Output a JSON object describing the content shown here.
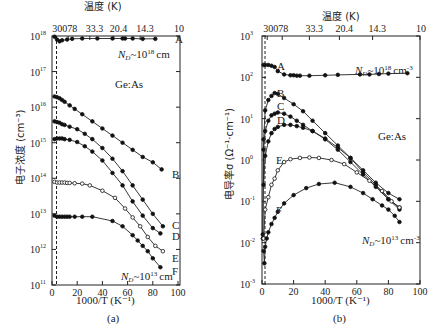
{
  "chart_data": [
    {
      "type": "line",
      "panel_label": "(a)",
      "title": "",
      "xlabel": "1000/T (K⁻¹)",
      "ylabel": "电子浓度 (cm⁻³)",
      "top_axis_label": "温度 (K)",
      "top_ticks": [
        "300",
        "78",
        "33.3",
        "20.4",
        "14.3",
        "10"
      ],
      "top_tick_positions_x": [
        3.3,
        12.8,
        30,
        49,
        70,
        100
      ],
      "xlim": [
        0,
        100
      ],
      "xticks": [
        "0",
        "20",
        "40",
        "60",
        "80",
        "100"
      ],
      "yscale": "log",
      "ylim_exp": [
        11,
        18
      ],
      "yticks": [
        "10^11",
        "10^12",
        "10^13",
        "10^14",
        "10^15",
        "10^16",
        "10^17",
        "10^18"
      ],
      "annotations": [
        "Ge:As",
        "N_D~10^18 cm^-3",
        "N_D~10^13 cm^-3"
      ],
      "dashed_vline_x": 3.5,
      "series": [
        {
          "name": "A",
          "marker": "filled",
          "x": [
            2,
            4,
            6,
            8,
            12,
            16,
            24,
            36,
            48,
            56,
            58,
            64,
            72,
            82
          ],
          "log10_y": [
            17.98,
            17.9,
            17.85,
            17.88,
            17.9,
            17.92,
            17.93,
            17.93,
            17.93,
            17.93,
            17.93,
            17.93,
            17.92,
            17.92
          ]
        },
        {
          "name": "B",
          "marker": "filled",
          "x": [
            2,
            4,
            6,
            8,
            10,
            14,
            18,
            24,
            32,
            40,
            48,
            56,
            64,
            72,
            80,
            87
          ],
          "log10_y": [
            16.3,
            16.28,
            16.25,
            16.2,
            16.15,
            16.05,
            15.95,
            15.8,
            15.6,
            15.4,
            15.2,
            15.0,
            14.8,
            14.6,
            14.45,
            14.25
          ]
        },
        {
          "name": "C",
          "marker": "filled",
          "x": [
            2,
            4,
            6,
            8,
            10,
            14,
            20,
            26,
            32,
            40,
            48,
            56,
            64,
            72,
            80,
            88
          ],
          "log10_y": [
            15.6,
            15.58,
            15.56,
            15.52,
            15.5,
            15.45,
            15.38,
            15.25,
            15.1,
            14.85,
            14.55,
            14.2,
            13.8,
            13.4,
            13.0,
            12.65
          ]
        },
        {
          "name": "D",
          "marker": "filled",
          "x": [
            2,
            4,
            6,
            8,
            10,
            14,
            20,
            26,
            32,
            40,
            48,
            56,
            64,
            72,
            80,
            86
          ],
          "log10_y": [
            15.1,
            15.12,
            15.12,
            15.12,
            15.1,
            15.08,
            15.02,
            14.9,
            14.75,
            14.5,
            14.15,
            13.8,
            13.35,
            12.95,
            12.6,
            12.45
          ]
        },
        {
          "name": "E",
          "marker": "open",
          "x": [
            2,
            4,
            6,
            8,
            10,
            12,
            14,
            18,
            24,
            30,
            40,
            50,
            58,
            64,
            70,
            76,
            82,
            88
          ],
          "log10_y": [
            13.9,
            13.88,
            13.88,
            13.88,
            13.88,
            13.87,
            13.87,
            13.86,
            13.85,
            13.8,
            13.65,
            13.45,
            13.15,
            12.9,
            12.65,
            12.35,
            12.1,
            11.95
          ]
        },
        {
          "name": "F",
          "marker": "filled",
          "x": [
            2,
            4,
            6,
            8,
            10,
            12,
            14,
            18,
            24,
            32,
            48,
            56,
            64,
            68,
            72,
            76,
            80,
            86
          ],
          "log10_y": [
            12.95,
            12.92,
            12.92,
            12.92,
            12.92,
            12.92,
            12.92,
            12.92,
            12.92,
            12.92,
            12.8,
            12.65,
            12.4,
            12.25,
            12.1,
            11.95,
            11.75,
            11.5
          ]
        }
      ],
      "series_labels_right": [
        "A",
        "B",
        "C",
        "D",
        "E",
        "F"
      ]
    },
    {
      "type": "line",
      "panel_label": "(b)",
      "title": "",
      "xlabel": "1000/T (K⁻¹)",
      "ylabel": "电导率σ (Ω⁻¹·cm⁻¹)",
      "top_axis_label": "温度 (K)",
      "top_ticks": [
        "300",
        "78",
        "33.3",
        "20.4",
        "14.3",
        "10"
      ],
      "top_tick_positions_x": [
        3.3,
        12.8,
        30,
        49,
        70,
        100
      ],
      "xlim": [
        0,
        100
      ],
      "xticks": [
        "0",
        "20",
        "40",
        "60",
        "80",
        "100"
      ],
      "yscale": "log",
      "ylim_exp": [
        -3,
        3
      ],
      "yticks": [
        "10^-3",
        "10^-2",
        "10^-1",
        "10^0",
        "10^1",
        "10^2",
        "10^3"
      ],
      "annotations": [
        "Ge:As",
        "N_D~10^18 cm^-3",
        "N_D~10^13 cm^-3"
      ],
      "dashed_vline_x": 2,
      "series": [
        {
          "name": "A",
          "marker": "filled",
          "x": [
            1,
            2,
            4,
            6,
            8,
            10,
            14,
            18,
            20,
            22,
            24,
            30,
            40,
            48,
            62,
            68,
            74,
            80,
            92
          ],
          "log10_y": [
            2.3,
            2.3,
            2.3,
            2.28,
            2.25,
            2.15,
            2.07,
            2.05,
            2.05,
            2.04,
            2.04,
            2.04,
            2.05,
            2.06,
            2.07,
            2.07,
            2.08,
            2.09,
            2.1
          ]
        },
        {
          "name": "B",
          "marker": "filled",
          "x": [
            0.5,
            1,
            2,
            4,
            6,
            8,
            10,
            14,
            20,
            26,
            32,
            40,
            48,
            56,
            64,
            72,
            80,
            87
          ],
          "log10_y": [
            -1.9,
            0.5,
            1.2,
            1.45,
            1.55,
            1.62,
            1.6,
            1.5,
            1.35,
            1.18,
            0.95,
            0.65,
            0.35,
            0.05,
            -0.25,
            -0.55,
            -0.8,
            -0.95
          ]
        },
        {
          "name": "C",
          "marker": "filled",
          "x": [
            0.5,
            1,
            2,
            4,
            6,
            8,
            10,
            14,
            18,
            22,
            26,
            32,
            40,
            48,
            56,
            64,
            72,
            80,
            87
          ],
          "log10_y": [
            -1.8,
            0.25,
            0.7,
            0.95,
            1.08,
            1.12,
            1.15,
            1.12,
            1.05,
            0.95,
            0.85,
            0.7,
            0.5,
            0.25,
            -0.05,
            -0.35,
            -0.65,
            -0.95,
            -1.15
          ]
        },
        {
          "name": "D",
          "marker": "filled",
          "x": [
            1,
            2,
            4,
            6,
            8,
            10,
            14,
            18,
            22,
            26,
            32,
            40,
            48,
            56,
            64,
            72,
            80,
            87
          ],
          "log10_y": [
            -0.6,
            0.1,
            0.45,
            0.65,
            0.75,
            0.8,
            0.85,
            0.85,
            0.82,
            0.78,
            0.7,
            0.52,
            0.3,
            0.05,
            -0.3,
            -0.6,
            -0.95,
            -1.2
          ]
        },
        {
          "name": "E",
          "marker": "open",
          "x": [
            1,
            2,
            4,
            6,
            8,
            10,
            14,
            18,
            24,
            30,
            36,
            44,
            52,
            60,
            68,
            76,
            82,
            87
          ],
          "log10_y": [
            -1.9,
            -1.2,
            -0.9,
            -0.6,
            -0.45,
            -0.25,
            -0.05,
            0.02,
            0.05,
            0.06,
            0.05,
            0.0,
            -0.1,
            -0.3,
            -0.5,
            -0.75,
            -1.0,
            -1.15
          ]
        },
        {
          "name": "F",
          "marker": "filled",
          "x": [
            1,
            1.5,
            2,
            3,
            4,
            6,
            8,
            10,
            14,
            20,
            28,
            36,
            46,
            56,
            64,
            70,
            76,
            80,
            84,
            87
          ],
          "log10_y": [
            -2.2,
            -2.5,
            -2.1,
            -1.9,
            -1.75,
            -1.55,
            -1.4,
            -1.25,
            -1.05,
            -0.85,
            -0.68,
            -0.58,
            -0.55,
            -0.65,
            -0.8,
            -0.95,
            -1.1,
            -1.2,
            -1.35,
            -1.5
          ]
        }
      ]
    }
  ],
  "panels": {
    "a": {
      "top_title": "温度 (K)",
      "top_ticks": [
        "300",
        "78",
        "33.3",
        "20.4",
        "14.3",
        "10"
      ],
      "top_tick_first": "30078",
      "ylabel": "电子浓度 (cm⁻³)",
      "xlabel": "1000/T (K⁻¹)",
      "caption": "(a)",
      "material": "Ge:As",
      "nd_high": "N",
      "nd_high_sub": "D",
      "nd_high_rest": "~10",
      "nd_high_exp": "18",
      "nd_high_unit": "cm",
      "nd_low_rest": "~10",
      "nd_low_exp": "13",
      "nd_low_unit": "cm",
      "xticks": [
        "0",
        "20",
        "40",
        "60",
        "80",
        "100"
      ],
      "ytick_base": "10",
      "ytick_exps": [
        "18",
        "17",
        "16",
        "15",
        "14",
        "13",
        "12",
        "11"
      ],
      "labels": [
        "A",
        "B",
        "C",
        "D",
        "E",
        "F"
      ]
    },
    "b": {
      "top_title": "温度 (K)",
      "top_ticks": [
        "78",
        "33.3",
        "20.4",
        "14.3",
        "10"
      ],
      "top_tick_first": "300",
      "ylabel": "电导率σ (Ω⁻¹·cm⁻¹)",
      "xlabel": "1000/T (K⁻¹)",
      "caption": "(b)",
      "material": "Ge:As",
      "nd_high_rest": "~10",
      "nd_high_exp": "18",
      "nd_high_unit": "cm",
      "nd_high_unit_exp": "-3",
      "nd_low_rest": "~10",
      "nd_low_exp": "13",
      "nd_low_unit": "cm",
      "nd_low_unit_exp": "-3",
      "xticks": [
        "0",
        "20",
        "40",
        "60",
        "80",
        "100"
      ],
      "ytick_base": "10",
      "ytick_exps": [
        "3",
        "2",
        "1",
        "0",
        "-1",
        "-2",
        "-3"
      ],
      "labels": [
        "A",
        "B",
        "C",
        "D",
        "E",
        "F"
      ]
    }
  }
}
